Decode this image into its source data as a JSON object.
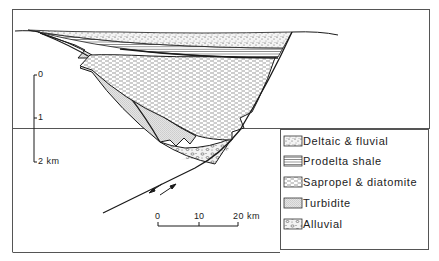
{
  "figure": {
    "type": "geological-cross-section",
    "border_color": "#555555",
    "line_color": "#1a1a1a"
  },
  "depth_scale": {
    "ticks": [
      "0",
      "1",
      "2 km"
    ]
  },
  "horizontal_scale": {
    "ticks": [
      "0",
      "10",
      "20 km"
    ]
  },
  "legend": {
    "items": [
      {
        "label": "Deltaic & fluvial",
        "pattern": "stipple"
      },
      {
        "label": "Prodelta shale",
        "pattern": "horizontal-lines"
      },
      {
        "label": "Sapropel & diatomite",
        "pattern": "dashed-lines"
      },
      {
        "label": "Turbidite",
        "pattern": "fine-dots"
      },
      {
        "label": "Alluvial",
        "pattern": "pebbles"
      }
    ]
  },
  "fault": {
    "arrows": "opposing-shear-arrows"
  }
}
